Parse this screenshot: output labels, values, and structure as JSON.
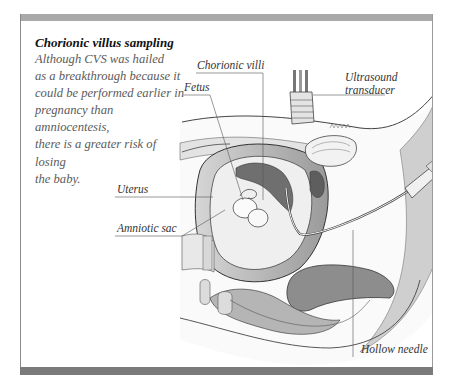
{
  "figure": {
    "frame_colors": {
      "top_bar": "#a9a9a9",
      "bottom_bar": "#7b7b7b",
      "border": "#8a8a8a"
    },
    "caption": {
      "title": "Chorionic villus sampling",
      "body_lines": [
        "Although CVS was hailed",
        "as a breakthrough because it",
        "could be performed earlier in",
        "pregnancy than amniocentesis,",
        "there is a greater risk of losing",
        "the baby."
      ]
    },
    "labels": {
      "chorionic_villi": "Chorionic villi",
      "fetus": "Fetus",
      "ultrasound_transducer_line1": "Ultrasound",
      "ultrasound_transducer_line2": "transducer",
      "uterus": "Uterus",
      "amniotic_sac": "Amniotic sac",
      "hollow_needle": "Hollow needle"
    }
  }
}
